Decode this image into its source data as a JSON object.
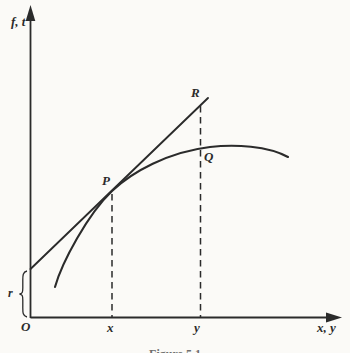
{
  "figure": {
    "axis": {
      "y_label": "f, t",
      "x_label": "x, y"
    },
    "origin_label": "O",
    "ticks": {
      "x_tick": "x",
      "y_tick": "y"
    },
    "intercept_label": "r",
    "points": {
      "p": "P",
      "q": "Q",
      "r": "R"
    },
    "caption": "Figure 5.1",
    "colors": {
      "ink": "#2b2b2b",
      "paper": "#fbfaf7"
    }
  }
}
